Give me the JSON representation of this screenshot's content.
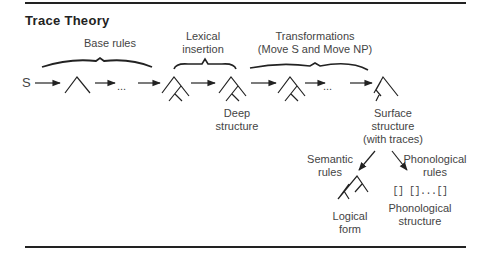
{
  "title": "Trace Theory",
  "start_symbol": "S",
  "ellipsis": "...",
  "groups": {
    "base_rules": "Base rules",
    "lexical_insertion": [
      "Lexical",
      "insertion"
    ],
    "transformations": [
      "Transformations",
      "(Move S and Move NP)"
    ]
  },
  "nodes": {
    "deep_structure": [
      "Deep",
      "structure"
    ],
    "surface_structure": [
      "Surface",
      "structure",
      "(with traces)"
    ],
    "logical_form": [
      "Logical",
      "form"
    ],
    "phonological_structure": [
      "Phonological",
      "structure"
    ]
  },
  "branches": {
    "semantic_rules": [
      "Semantic",
      "rules"
    ],
    "phonological_rules": [
      "Phonological",
      "rules"
    ]
  },
  "phonological_brackets": "[] []...[]"
}
